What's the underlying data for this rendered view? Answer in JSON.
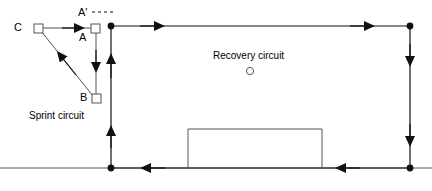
{
  "diagram": {
    "type": "training-circuit-diagram",
    "stroke_color": "#1a1a1a",
    "background_color": "#ffffff",
    "labels": {
      "node_c": "C",
      "node_a": "A",
      "node_a_prime": "A'",
      "node_b": "B",
      "sprint_circuit": "Sprint circuit",
      "recovery_circuit": "Recovery circuit"
    },
    "markers": {
      "square_nodes": [
        "C",
        "A",
        "B"
      ],
      "circle_marker": "recovery-circuit-cone",
      "corner_dots": 4,
      "arrow_count_top": 2,
      "arrow_count_right": 2,
      "arrow_count_bottom": 2,
      "arrow_count_left": 2
    },
    "geometry": {
      "outer_track": {
        "left": 111,
        "top": 26,
        "right": 410,
        "bottom": 168,
        "direction": "clockwise"
      },
      "infield_box": {
        "left": 188,
        "top": 129,
        "right": 322,
        "bottom": 168,
        "open_side": "bottom"
      },
      "sprint_nodes": {
        "C": [
          38,
          28
        ],
        "A": [
          95,
          28
        ],
        "B": [
          96,
          98
        ]
      },
      "recovery_marker": [
        250,
        71
      ],
      "bottom_line_extends": [
        0,
        432
      ]
    }
  }
}
